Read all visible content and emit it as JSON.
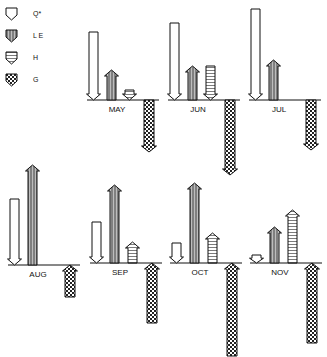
{
  "legend": [
    {
      "key": "Q",
      "label": "Q*",
      "fill": "none"
    },
    {
      "key": "LE",
      "label": "L E",
      "fill": "vertical-hatch"
    },
    {
      "key": "H",
      "label": "H",
      "fill": "horizontal-hatch"
    },
    {
      "key": "G",
      "label": "G",
      "fill": "crosshatch"
    }
  ],
  "chart_data": {
    "type": "bar",
    "title": "",
    "note": "Monthly energy flux arrows; arrow direction shows sign (down = toward surface for Q*, up = away). Values in relative pixel length units read from figure.",
    "categories": [
      "MAY",
      "JUN",
      "JUL",
      "AUG",
      "SEP",
      "OCT",
      "NOV"
    ],
    "series": [
      {
        "name": "Q*",
        "direction": [
          "down",
          "down",
          "down",
          "down",
          "down",
          "down",
          "down"
        ],
        "values": [
          68,
          77,
          91,
          66,
          41,
          20,
          8
        ]
      },
      {
        "name": "LE",
        "direction": [
          "up",
          "up",
          "up",
          "up",
          "up",
          "up",
          "up"
        ],
        "values": [
          30,
          34,
          40,
          100,
          78,
          80,
          36
        ]
      },
      {
        "name": "H",
        "direction": [
          "down",
          "down",
          "none",
          "none",
          "up",
          "up",
          "up"
        ],
        "values": [
          10,
          34,
          0,
          0,
          21,
          30,
          53
        ]
      },
      {
        "name": "G",
        "direction": [
          "down",
          "down",
          "down",
          "up",
          "up",
          "up",
          "up"
        ],
        "values": [
          52,
          75,
          50,
          32,
          60,
          93,
          80
        ]
      }
    ]
  },
  "panels": [
    {
      "month": "MAY",
      "x": 87,
      "base": 100,
      "Q": {
        "len": 68,
        "dir": "down"
      },
      "LE": {
        "len": 30,
        "dir": "up"
      },
      "H": {
        "len": 10,
        "dir": "down"
      },
      "G": {
        "len": 52,
        "dir": "down"
      }
    },
    {
      "month": "JUN",
      "x": 168,
      "base": 100,
      "Q": {
        "len": 77,
        "dir": "down"
      },
      "LE": {
        "len": 34,
        "dir": "up"
      },
      "H": {
        "len": 34,
        "dir": "down"
      },
      "G": {
        "len": 75,
        "dir": "down"
      }
    },
    {
      "month": "JUL",
      "x": 249,
      "base": 100,
      "Q": {
        "len": 91,
        "dir": "down"
      },
      "LE": {
        "len": 40,
        "dir": "up"
      },
      "H": {
        "len": 0,
        "dir": "none"
      },
      "G": {
        "len": 50,
        "dir": "down"
      }
    },
    {
      "month": "AUG",
      "x": 8,
      "base": 265,
      "Q": {
        "len": 66,
        "dir": "down"
      },
      "LE": {
        "len": 100,
        "dir": "up"
      },
      "H": {
        "len": 0,
        "dir": "none"
      },
      "G": {
        "len": 32,
        "dir": "up"
      }
    },
    {
      "month": "SEP",
      "x": 90,
      "base": 263,
      "Q": {
        "len": 41,
        "dir": "down"
      },
      "LE": {
        "len": 78,
        "dir": "up"
      },
      "H": {
        "len": 21,
        "dir": "up"
      },
      "G": {
        "len": 60,
        "dir": "up"
      }
    },
    {
      "month": "OCT",
      "x": 170,
      "base": 263,
      "Q": {
        "len": 20,
        "dir": "down"
      },
      "LE": {
        "len": 80,
        "dir": "up"
      },
      "H": {
        "len": 30,
        "dir": "up"
      },
      "G": {
        "len": 93,
        "dir": "up"
      }
    },
    {
      "month": "NOV",
      "x": 250,
      "base": 263,
      "Q": {
        "len": 8,
        "dir": "down"
      },
      "LE": {
        "len": 36,
        "dir": "up"
      },
      "H": {
        "len": 53,
        "dir": "up"
      },
      "G": {
        "len": 80,
        "dir": "up"
      }
    }
  ]
}
